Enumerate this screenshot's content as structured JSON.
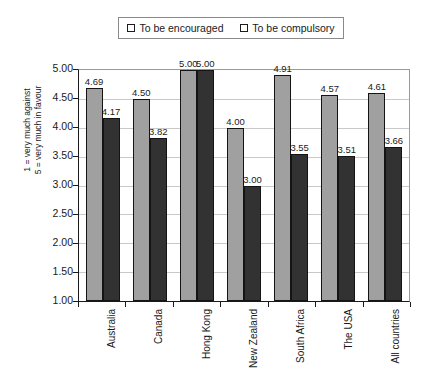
{
  "legend": {
    "position": "top-center",
    "entries": [
      {
        "label": "To be encouraged",
        "color": "#a0a0a0",
        "icon": "square-swatch-icon"
      },
      {
        "label": "To be compulsory",
        "color": "#323232",
        "icon": "square-swatch-icon"
      }
    ]
  },
  "axis": {
    "ylabel_line1": "1 = very much against",
    "ylabel_line2": "5 = very much in favour",
    "yticks": [
      "5.00",
      "4.50",
      "4.00",
      "3.50",
      "3.00",
      "2.50",
      "2.00",
      "1.50",
      "1.00"
    ],
    "ytick_values": [
      5.0,
      4.5,
      4.0,
      3.5,
      3.0,
      2.5,
      2.0,
      1.5,
      1.0
    ]
  },
  "chart_data": {
    "type": "bar",
    "title": "",
    "xlabel": "",
    "ylabel": "1 = very much against / 5 = very much in favour",
    "ylim": [
      1.0,
      5.0
    ],
    "ytick_step": 0.5,
    "grid": true,
    "legend_position": "top-center",
    "categories": [
      "Australia",
      "Canada",
      "Hong Kong",
      "New Zealand",
      "South Africa",
      "The USA",
      "All countries"
    ],
    "series": [
      {
        "name": "To be encouraged",
        "color": "#a0a0a0",
        "values": [
          4.69,
          4.5,
          5.0,
          4.0,
          4.91,
          4.57,
          4.61
        ],
        "labels": [
          "4.69",
          "4.50",
          "5.00",
          "4.00",
          "4.91",
          "4.57",
          "4.61"
        ]
      },
      {
        "name": "To be compulsory",
        "color": "#323232",
        "values": [
          4.17,
          3.82,
          5.0,
          3.0,
          3.55,
          3.51,
          3.66
        ],
        "labels": [
          "4.17",
          "3.82",
          "5.00",
          "3.00",
          "3.55",
          "3.51",
          "3.66"
        ]
      }
    ]
  }
}
